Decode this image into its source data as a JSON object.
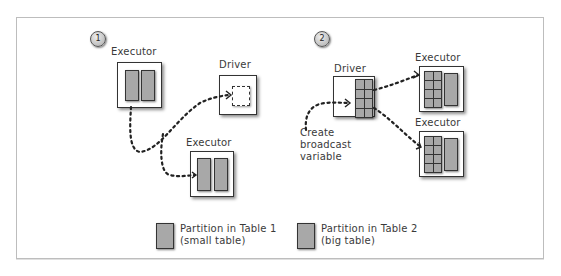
{
  "diagram": {
    "panel1": {
      "step_badge": "1",
      "executor_top": {
        "label": "Executor",
        "partitions": [
          "Partition in Table 2",
          "Partition in Table 2"
        ]
      },
      "driver": {
        "label": "Driver",
        "content": "empty dashed placeholder"
      },
      "executor_bottom": {
        "label": "Executor",
        "partitions": [
          "Partition in Table 2",
          "Partition in Table 2"
        ]
      }
    },
    "panel2": {
      "step_badge": "2",
      "driver": {
        "label": "Driver",
        "content": "Partition in Table 1 (grid 2x4)"
      },
      "annotation": "Create\nbroadcast\nvariable",
      "executor_top": {
        "label": "Executor"
      },
      "executor_bottom": {
        "label": "Executor"
      }
    },
    "legend": [
      {
        "label": "Partition in Table 1\n(small table)",
        "swatch_color": "#a8a8a8"
      },
      {
        "label": "Partition in Table 2\n(big table)",
        "swatch_color": "#a8a8a8"
      }
    ],
    "colors": {
      "partition_fill": "#a8a8a8",
      "outline": "#333333",
      "frame": "#bdbdbd"
    }
  }
}
